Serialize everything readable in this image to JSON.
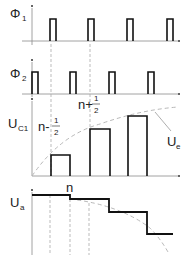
{
  "diagram": {
    "title": "",
    "panels": [
      {
        "id": "phi1",
        "label": "Φ",
        "subscript": "1",
        "axis_x": 32,
        "baseline_y": 41,
        "top_y": 6,
        "pulse_top_y": 19,
        "pulse_width": 6,
        "pulse_x": [
          50,
          88,
          127,
          167
        ]
      },
      {
        "id": "phi2",
        "label": "Φ",
        "subscript": "2",
        "axis_x": 32,
        "baseline_y": 94,
        "top_y": 60,
        "pulse_top_y": 72,
        "pulse_width": 6,
        "pulse_x": [
          32,
          70,
          109,
          148
        ]
      },
      {
        "id": "uc1",
        "label": "U",
        "subscript": "C1",
        "axis_x": 32,
        "baseline_y": 176,
        "top_y": 99,
        "bars": [
          {
            "x": 51,
            "w": 19,
            "top": 155
          },
          {
            "x": 90,
            "w": 20,
            "top": 129
          },
          {
            "x": 128,
            "w": 19,
            "top": 116
          }
        ],
        "annotations": [
          {
            "text": "n-",
            "num": "1",
            "den": "2",
            "x": 38,
            "y": 131
          },
          {
            "text": "n+",
            "num": "1",
            "den": "2",
            "x": 78,
            "y": 109
          }
        ],
        "curve_label": "U",
        "curve_label_sub": "e"
      },
      {
        "id": "ua",
        "label": "U",
        "subscript": "a",
        "axis_x": 32,
        "top_y": 190,
        "steps": [
          [
            32,
            195
          ],
          [
            70,
            195
          ],
          [
            70,
            199
          ],
          [
            109,
            199
          ],
          [
            109,
            212
          ],
          [
            147,
            212
          ],
          [
            147,
            234
          ],
          [
            173,
            234
          ]
        ],
        "annotation": "n"
      }
    ]
  }
}
